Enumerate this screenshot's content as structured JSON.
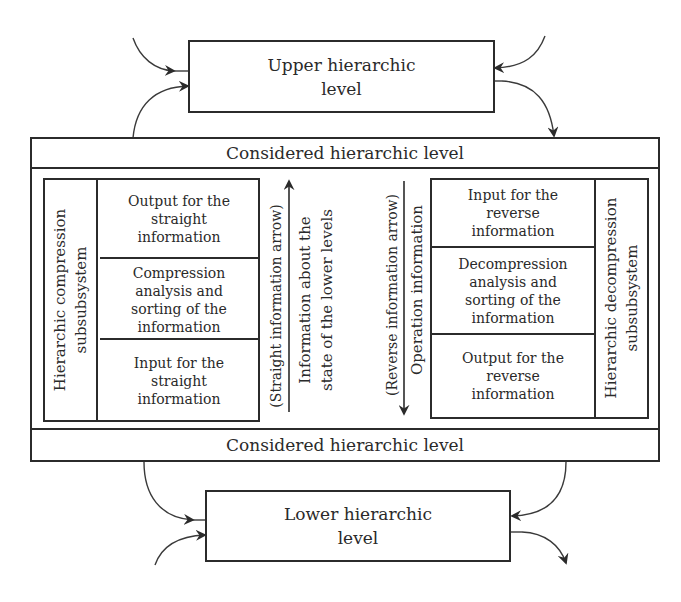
{
  "diagram": {
    "upper_level": {
      "label_line1": "Upper hierarchic",
      "label_line2": "level"
    },
    "lower_level": {
      "label_line1": "Lower hierarchic",
      "label_line2": "level"
    },
    "considered_level": {
      "top_header": "Considered hierarchic level",
      "bottom_header": "Considered hierarchic level",
      "compression_subsystem": {
        "title_line1": "Hierarchic compression",
        "title_line2": "subsubsystem",
        "cells": [
          {
            "lines": [
              "Output for the",
              "straight",
              "information"
            ]
          },
          {
            "lines": [
              "Compression",
              "analysis and",
              "sorting of the",
              "information"
            ]
          },
          {
            "lines": [
              "Input for the",
              "straight",
              "information"
            ]
          }
        ]
      },
      "straight_arrow": {
        "caption": "(Straight information arrow)",
        "label_line1": "Information about the",
        "label_line2": "state of the lower levels",
        "direction": "up"
      },
      "reverse_arrow": {
        "caption": "(Reverse information arrow)",
        "label": "Operation information",
        "direction": "down"
      },
      "decompression_subsystem": {
        "title_line1": "Hierarchic decompression",
        "title_line2": "subsubsystem",
        "cells": [
          {
            "lines": [
              "Input for the",
              "reverse",
              "information"
            ]
          },
          {
            "lines": [
              "Decompression",
              "analysis and",
              "sorting of the",
              "information"
            ]
          },
          {
            "lines": [
              "Output for the",
              "reverse",
              "information"
            ]
          }
        ]
      }
    },
    "colors": {
      "line": "#2b2b2b",
      "text": "#2a2a2a",
      "background": "#ffffff"
    }
  }
}
